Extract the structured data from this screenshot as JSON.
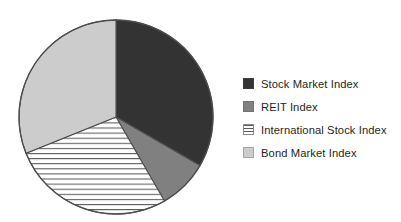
{
  "chart_data": {
    "type": "pie",
    "title": "",
    "subtitle": "",
    "xlabel": "",
    "ylabel": "",
    "grid": false,
    "legend_position": "right",
    "start_angle_deg": 0,
    "direction": "clockwise",
    "categories": [
      "Stock Market Index",
      "REIT Index",
      "International Stock Index",
      "Bond Market Index"
    ],
    "values": [
      33.3,
      8.3,
      27.2,
      31.1
    ],
    "slices": [
      {
        "label": "Stock Market Index",
        "value": 33.3,
        "start_deg": 0,
        "end_deg": 120,
        "fill": "#333333",
        "pattern": "solid",
        "swatch_fill": "#333333"
      },
      {
        "label": "REIT Index",
        "value": 8.3,
        "start_deg": 120,
        "end_deg": 150,
        "fill": "#808080",
        "pattern": "solid",
        "swatch_fill": "#808080"
      },
      {
        "label": "International Stock Index",
        "value": 27.2,
        "start_deg": 150,
        "end_deg": 248,
        "fill": "#ffffff",
        "pattern": "horizontal-stripes",
        "swatch_fill": "#ffffff"
      },
      {
        "label": "Bond Market Index",
        "value": 31.1,
        "start_deg": 248,
        "end_deg": 360,
        "fill": "#cccccc",
        "pattern": "solid",
        "swatch_fill": "#cccccc"
      }
    ],
    "geometry": {
      "center_x": 116,
      "center_y": 117,
      "radius": 97
    },
    "colors": {
      "outline": "#4d4d4d",
      "stripe_line": "#595959",
      "background": "#ffffff",
      "text": "#231f20"
    }
  },
  "legend": {
    "items": [
      {
        "label": "Stock Market Index",
        "swatch": "stock-market-index-swatch"
      },
      {
        "label": "REIT Index",
        "swatch": "reit-index-swatch"
      },
      {
        "label": "International Stock Index",
        "swatch": "international-stock-index-swatch"
      },
      {
        "label": "Bond Market Index",
        "swatch": "bond-market-index-swatch"
      }
    ]
  }
}
